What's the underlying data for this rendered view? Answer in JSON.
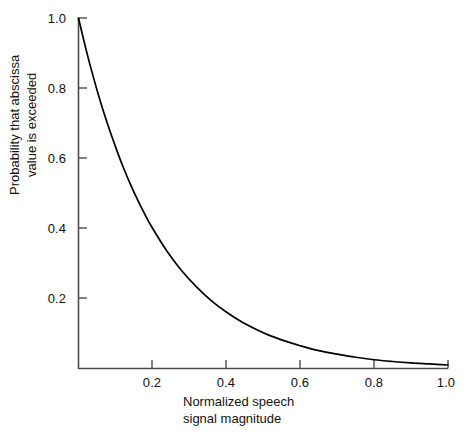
{
  "chart_data": {
    "type": "line",
    "title": "",
    "xlabel": "Normalized speech signal magnitude",
    "ylabel": "Probability that abscissa value is exceeded",
    "xlabel_lines": [
      "Normalized speech",
      "signal magnitude"
    ],
    "ylabel_lines": [
      "Probability that abscissa",
      "value is exceeded"
    ],
    "xlim": [
      0.0,
      1.0
    ],
    "ylim": [
      0.0,
      1.0
    ],
    "grid": false,
    "legend": null,
    "xticks": [
      0.2,
      0.4,
      0.6,
      0.8,
      1.0
    ],
    "xtick_labels": [
      "0.2",
      "0.4",
      "0.6",
      "0.8",
      "1.0"
    ],
    "yticks": [
      0.2,
      0.4,
      0.6,
      0.8,
      1.0
    ],
    "ytick_labels": [
      "0.2",
      "0.4",
      "0.6",
      "0.8",
      "1.0"
    ],
    "line_color": "#000000",
    "axis_color": "#4d4d4d",
    "series": [
      {
        "name": "exceedance probability",
        "x": [
          0.0,
          0.02,
          0.04,
          0.06,
          0.08,
          0.1,
          0.12,
          0.14,
          0.16,
          0.18,
          0.2,
          0.24,
          0.28,
          0.32,
          0.36,
          0.4,
          0.44,
          0.48,
          0.52,
          0.56,
          0.6,
          0.65,
          0.7,
          0.75,
          0.8,
          0.85,
          0.9,
          0.95,
          1.0
        ],
        "y": [
          1.0,
          0.912,
          0.832,
          0.759,
          0.693,
          0.633,
          0.577,
          0.527,
          0.481,
          0.439,
          0.401,
          0.334,
          0.278,
          0.232,
          0.193,
          0.161,
          0.134,
          0.112,
          0.093,
          0.078,
          0.065,
          0.051,
          0.041,
          0.032,
          0.025,
          0.02,
          0.016,
          0.013,
          0.01
        ]
      }
    ]
  },
  "axes": {
    "ytick_labels": [
      "1.0",
      "0.8",
      "0.6",
      "0.4",
      "0.2"
    ],
    "xtick_labels": [
      "0.2",
      "0.4",
      "0.6",
      "0.8",
      "1.0"
    ],
    "xlabel_line1": "Normalized speech",
    "xlabel_line2": "signal magnitude",
    "ylabel_line1": "Probability that abscissa",
    "ylabel_line2": "value is exceeded"
  }
}
